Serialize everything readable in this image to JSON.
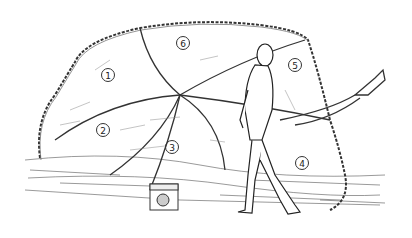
{
  "illustration": {
    "subject": "line drawing of a person walking past a large boulder wrapped in a rope net",
    "labels": [
      {
        "id": "1",
        "text": "1",
        "x": 101,
        "y": 68
      },
      {
        "id": "2",
        "text": "2",
        "x": 96,
        "y": 123
      },
      {
        "id": "3",
        "text": "3",
        "x": 165,
        "y": 140
      },
      {
        "id": "4",
        "text": "4",
        "x": 295,
        "y": 156
      },
      {
        "id": "5",
        "text": "5",
        "x": 288,
        "y": 58
      },
      {
        "id": "6",
        "text": "6",
        "x": 176,
        "y": 36
      }
    ]
  }
}
